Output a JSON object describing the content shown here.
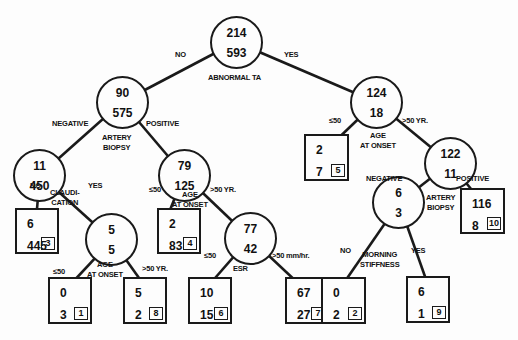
{
  "nodes": {
    "root": {
      "v1": "214",
      "v2": "593",
      "split": "ABNORMAL TA"
    },
    "n90": {
      "v1": "90",
      "v2": "575",
      "split": "ARTERY BIOPSY"
    },
    "n124": {
      "v1": "124",
      "v2": "18",
      "split": "AGE AT ONSET"
    },
    "n11": {
      "v1": "11",
      "v2": "450",
      "split": "CLAUDI- CATION"
    },
    "n79": {
      "v1": "79",
      "v2": "125",
      "split": "AGE AT ONSET"
    },
    "n122": {
      "v1": "122",
      "v2": "11",
      "split": "ARTERY BIOPSY"
    },
    "n5": {
      "v1": "5",
      "v2": "5",
      "split": "AGE AT ONSET"
    },
    "n77": {
      "v1": "77",
      "v2": "42",
      "split": "ESR"
    },
    "n6": {
      "v1": "6",
      "v2": "3",
      "split": "MORNING STIFFNESS"
    }
  },
  "split_labels": {
    "claudication_1": "CLAUDI-",
    "claudication_2": "CATION",
    "artery_1": "ARTERY",
    "artery_2": "BIOPSY",
    "age_1": "AGE",
    "age_2": "AT ONSET",
    "esr": "ESR",
    "morning_1": "MORNING",
    "morning_2": "STIFFNESS",
    "abnormal_ta": "ABNORMAL TA"
  },
  "leaves": [
    {
      "id": "3",
      "v1": "6",
      "v2": "445"
    },
    {
      "id": "4",
      "v1": "2",
      "v2": "83"
    },
    {
      "id": "5",
      "v1": "2",
      "v2": "7"
    },
    {
      "id": "10",
      "v1": "116",
      "v2": "8"
    },
    {
      "id": "1",
      "v1": "0",
      "v2": "3"
    },
    {
      "id": "8",
      "v1": "5",
      "v2": "2"
    },
    {
      "id": "6",
      "v1": "10",
      "v2": "15"
    },
    {
      "id": "7",
      "v1": "67",
      "v2": "27"
    },
    {
      "id": "2",
      "v1": "0",
      "v2": "2"
    },
    {
      "id": "9",
      "v1": "6",
      "v2": "1"
    }
  ],
  "edge_labels": {
    "no": "NO",
    "yes": "YES",
    "negative": "NEGATIVE",
    "positive": "POSITIVE",
    "le50": "≤50",
    "gt50yr": ">50 YR.",
    "gt50mm": ">50 mm/hr."
  }
}
